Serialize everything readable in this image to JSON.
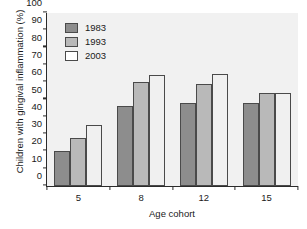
{
  "chart_data": {
    "type": "bar",
    "title": "",
    "xlabel": "Age cohort",
    "ylabel": "Children with gingival inflammation (%)",
    "categories": [
      "5",
      "8",
      "12",
      "15"
    ],
    "series": [
      {
        "name": "1983",
        "values": [
          20,
          46,
          48,
          48
        ],
        "color": "#8d8d8d"
      },
      {
        "name": "1993",
        "values": [
          28,
          60,
          59,
          54
        ],
        "color": "#b9b9b9"
      },
      {
        "name": "2003",
        "values": [
          35,
          64,
          65,
          54
        ],
        "color": "#f0f0f0"
      }
    ],
    "ylim": [
      0,
      100
    ],
    "yticks": [
      0,
      10,
      20,
      30,
      40,
      50,
      60,
      70,
      80,
      90,
      100
    ],
    "ytick_labels": [
      "0",
      "10",
      "20",
      "30",
      "40",
      "50",
      "60",
      "70",
      "80",
      "90",
      "100"
    ],
    "grid": false,
    "legend_position": "top-left",
    "plot_background": "#f1f1f1"
  }
}
